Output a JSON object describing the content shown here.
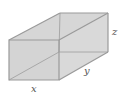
{
  "diagram": {
    "type": "rectangular-box",
    "labels": {
      "x": "x",
      "y": "y",
      "z": "z"
    },
    "colors": {
      "face": "#d8d8d8",
      "edge": "#9a9a9a",
      "hidden_edge": "#a8a8a8",
      "label": "#555555"
    }
  }
}
